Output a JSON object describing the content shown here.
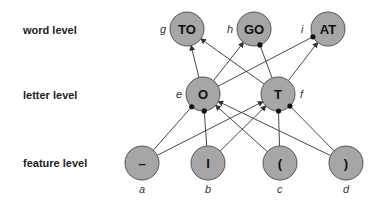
{
  "levels": {
    "word": "word level",
    "letter": "letter level",
    "feature": "feature level"
  },
  "nodes": {
    "g": {
      "label": "TO",
      "id": "g",
      "x": 187,
      "y": 29
    },
    "h": {
      "label": "GO",
      "id": "h",
      "x": 254,
      "y": 29
    },
    "i": {
      "label": "AT",
      "id": "i",
      "x": 328,
      "y": 29
    },
    "e": {
      "label": "O",
      "id": "e",
      "x": 203,
      "y": 94
    },
    "f": {
      "label": "T",
      "id": "f",
      "x": 278,
      "y": 94
    },
    "a": {
      "label": "–",
      "id": "a",
      "x": 142,
      "y": 163
    },
    "b": {
      "label": "I",
      "id": "b",
      "x": 208,
      "y": 163
    },
    "c": {
      "label": "(",
      "id": "c",
      "x": 280,
      "y": 163
    },
    "d": {
      "label": ")",
      "id": "d",
      "x": 346,
      "y": 163
    }
  },
  "edges": [
    {
      "from": "e",
      "to": "g",
      "type": "excitatory"
    },
    {
      "from": "e",
      "to": "h",
      "type": "excitatory"
    },
    {
      "from": "e",
      "to": "i",
      "type": "inhibitory"
    },
    {
      "from": "f",
      "to": "g",
      "type": "excitatory"
    },
    {
      "from": "f",
      "to": "h",
      "type": "inhibitory"
    },
    {
      "from": "f",
      "to": "i",
      "type": "excitatory"
    },
    {
      "from": "a",
      "to": "e",
      "type": "inhibitory"
    },
    {
      "from": "a",
      "to": "f",
      "type": "excitatory"
    },
    {
      "from": "b",
      "to": "e",
      "type": "inhibitory"
    },
    {
      "from": "b",
      "to": "f",
      "type": "excitatory"
    },
    {
      "from": "c",
      "to": "e",
      "type": "excitatory"
    },
    {
      "from": "c",
      "to": "f",
      "type": "inhibitory"
    },
    {
      "from": "d",
      "to": "e",
      "type": "excitatory"
    },
    {
      "from": "d",
      "to": "f",
      "type": "inhibitory"
    }
  ],
  "style": {
    "node_fill": "#a6a6a6",
    "node_stroke": "#555555",
    "edge": "#333333",
    "radius": 17
  }
}
